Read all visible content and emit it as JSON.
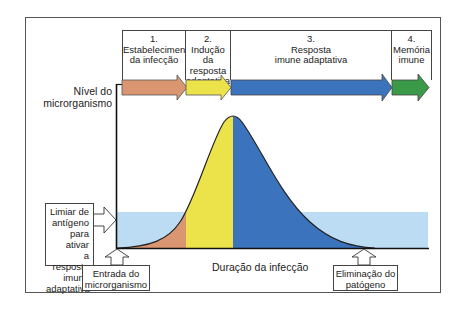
{
  "phases": [
    {
      "number": "1.",
      "line1": "Estabelecimento",
      "line2": "da infecção",
      "line3": "",
      "color": "#d99670"
    },
    {
      "number": "2.",
      "line1": "Indução da",
      "line2": "resposta",
      "line3": "adaptativa",
      "color": "#ece24a"
    },
    {
      "number": "3.",
      "line1": "Resposta",
      "line2": "imune adaptativa",
      "line3": "",
      "color": "#3b73bd"
    },
    {
      "number": "4.",
      "line1": "Memória",
      "line2": "imune",
      "line3": "",
      "color": "#3a9a48"
    }
  ],
  "axes": {
    "y_label_line1": "Nível do",
    "y_label_line2": "microrganismo",
    "x_label": "Duração da infecção"
  },
  "threshold": {
    "line1": "Limiar de",
    "line2": "antígeno",
    "line3": "para ativar",
    "line4": "a resposta",
    "line5": "imune",
    "line6": "adaptativa",
    "color": "#bcdcf3"
  },
  "events": {
    "entry_line1": "Entrada do",
    "entry_line2": "microrganismo",
    "elimination_line1": "Eliminação do",
    "elimination_line2": "patógeno"
  }
}
